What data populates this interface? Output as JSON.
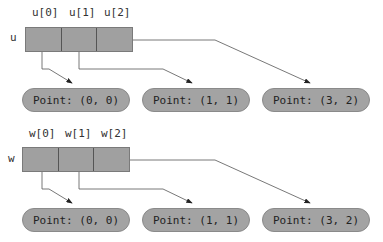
{
  "arrays": [
    {
      "name": "u",
      "labels": [
        "u[0]",
        "u[1]",
        "u[2]"
      ],
      "points": [
        "Point: (0, 0)",
        "Point: (1, 1)",
        "Point: (3, 2)"
      ]
    },
    {
      "name": "w",
      "labels": [
        "w[0]",
        "w[1]",
        "w[2]"
      ],
      "points": [
        "Point: (0, 0)",
        "Point: (1, 1)",
        "Point: (3, 2)"
      ]
    }
  ],
  "colors": {
    "cell_fill": "#a0a0a0",
    "pill_fill": "#a3a3a3",
    "line": "#555555"
  }
}
